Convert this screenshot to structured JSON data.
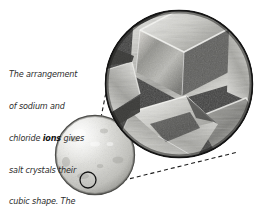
{
  "figure": {
    "background_color": "#ffffff",
    "width": 269,
    "height": 210
  },
  "caption": {
    "lines": [
      {
        "text": "The arrangement",
        "bold": false
      },
      {
        "text": "of sodium and",
        "bold": false
      },
      {
        "text": "chloride ",
        "bold_word": "ions",
        "tail": " gives"
      },
      {
        "text": "salt crystals their",
        "bold": false
      },
      {
        "text": "cubic shape. The",
        "bold": false
      },
      {
        "text": "ions are held",
        "bold": false
      },
      {
        "text": "together",
        "bold": false
      },
      {
        "text": "by ",
        "bold_word": "ionic",
        "tail": ""
      },
      {
        "text": "",
        "bold_word": "bonds",
        "tail": "."
      }
    ],
    "full_text": "The arrangement of sodium and chloride ions gives salt crystals their cubic shape. The ions are held together by ionic bonds.",
    "line_1": "The arrangement",
    "line_2": "of sodium and",
    "line_3a": "chloride ",
    "line_3b": "ions",
    "line_3c": " gives",
    "line_4": "salt crystals their",
    "line_5": "cubic shape. The",
    "line_6": "ions are held",
    "line_7": "together",
    "line_8a": "by ",
    "line_8b": "ionic",
    "line_9a": "bonds",
    "line_9b": ".",
    "text_color": "#2d2d2d",
    "bold_color": "#131313"
  },
  "salt_grain": {
    "label": "salt grain sphere",
    "center_x": 95,
    "center_y": 155,
    "radius": 40,
    "fill_color": "#d9d9d6",
    "rim_color": "#6b6b6b"
  },
  "detail_marker": {
    "label": "magnified region marker",
    "center_x": 88,
    "center_y": 180,
    "radius": 8,
    "stroke_color": "#1a1a1a"
  },
  "magnifier": {
    "label": "magnified salt crystals",
    "center_x": 179,
    "center_y": 84,
    "radius": 74,
    "background_color": "#4a4a4a",
    "rim_color": "#151515",
    "crystal_light": "#efefec",
    "crystal_mid": "#a8a8a4",
    "crystal_dark": "#5c5c5a"
  },
  "connectors": {
    "label": "dashed magnification leader lines",
    "color": "#1a1a1a",
    "dash_pattern": "4 3",
    "upper": {
      "x1": 90,
      "y1": 173,
      "x2": 110,
      "y2": 66
    },
    "lower": {
      "x1": 95,
      "y1": 186,
      "x2": 236,
      "y2": 150
    }
  }
}
